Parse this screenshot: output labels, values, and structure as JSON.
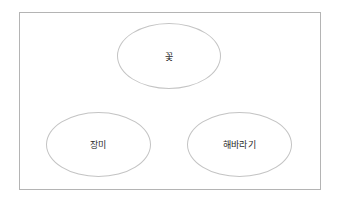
{
  "diagram": {
    "type": "hierarchy",
    "frame": {
      "border_color": "#b4b4b4"
    },
    "nodes": [
      {
        "id": "root",
        "label": "꽃"
      },
      {
        "id": "child1",
        "label": "장미"
      },
      {
        "id": "child2",
        "label": "해바라기"
      }
    ],
    "node_border_color": "#c4c4c4",
    "text_color": "#2a2a2a"
  }
}
